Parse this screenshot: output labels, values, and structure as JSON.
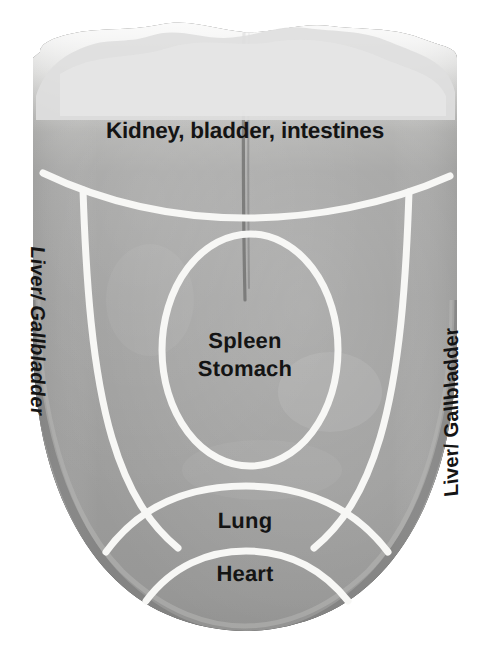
{
  "figure": {
    "kind": "tongue-diagnosis-map",
    "background_color": "#ffffff",
    "label_color": "#141414",
    "divider_color": "#f7f7f5",
    "tongue_body_color": "#9a9a9a",
    "tongue_tip_color": "#e8e8e8",
    "tongue_outline_color": "#2e2e2e"
  },
  "zones": {
    "root": {
      "label": "Kidney, bladder, intestines",
      "position": "tongue-root-top"
    },
    "center": {
      "line1": "Spleen",
      "line2": "Stomach",
      "position": "tongue-center-oval"
    },
    "lung": {
      "label": "Lung",
      "position": "tongue-front-band"
    },
    "heart": {
      "label": "Heart",
      "position": "tongue-tip"
    },
    "left_side": {
      "label": "Liver/ Gallbladder",
      "position": "tongue-left-edge"
    },
    "right_side": {
      "label": "Liver/ Gallbladder",
      "position": "tongue-right-edge"
    }
  }
}
